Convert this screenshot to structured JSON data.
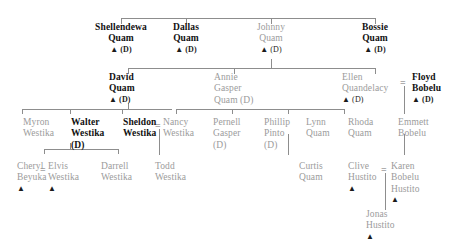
{
  "diagram": {
    "type": "genealogy-chart",
    "deceased_marker": "(D)",
    "potter_marker": "▲",
    "marriage_symbol": "=",
    "colors": {
      "line": "#8d8d8d",
      "gray_text": "#9b9b9b",
      "dark_text": "#1b1b1b",
      "bold_text": "#111111",
      "background": "#ffffff"
    }
  },
  "generations": [
    {
      "index": 1,
      "people": [
        {
          "id": "shellendewa_quam",
          "line1": "Shellendewa",
          "line2": "Quam",
          "marker": "▲ (D)",
          "style": "bold"
        },
        {
          "id": "dallas_quam",
          "line1": "Dallas",
          "line2": "Quam",
          "marker": "▲ (D)",
          "style": "bold"
        },
        {
          "id": "johnny_quam",
          "line1": "Johnny",
          "line2": "Quam",
          "marker": "▲ (D)",
          "style": "gray"
        },
        {
          "id": "bossie_quam",
          "line1": "Bossie",
          "line2": "Quam",
          "marker": "▲ (D)",
          "style": "bold"
        }
      ]
    },
    {
      "index": 2,
      "people": [
        {
          "id": "david_quam",
          "line1": "David",
          "line2": "Quam",
          "line3": "",
          "marker": "▲ (D)",
          "style": "bold"
        },
        {
          "id": "annie_gasper_quam",
          "line1": "Annie",
          "line2": "Gasper",
          "line3": "Quam (D)",
          "marker": "",
          "style": "gray"
        },
        {
          "id": "ellen_quandelacy",
          "line1": "Ellen",
          "line2": "Quandelacy",
          "line3": "",
          "marker": "▲ (D)",
          "style": "gray"
        },
        {
          "id": "floyd_bobelu",
          "line1": "Floyd",
          "line2": "Bobelu",
          "line3": "",
          "marker": "▲ (D)",
          "style": "bold"
        }
      ]
    },
    {
      "index": 3,
      "people": [
        {
          "id": "myron_westika",
          "line1": "Myron",
          "line2": "Westika",
          "line3": "",
          "marker": "",
          "style": "gray"
        },
        {
          "id": "walter_westika",
          "line1": "Walter",
          "line2": "Westika",
          "line3": "(D)",
          "marker": "",
          "style": "bold"
        },
        {
          "id": "sheldon_westika",
          "line1": "Sheldon",
          "line2": "Westika",
          "line3": "",
          "marker": "",
          "style": "bold"
        },
        {
          "id": "nancy_westika",
          "line1": "Nancy",
          "line2": "Westika",
          "line3": "",
          "marker": "",
          "style": "gray"
        },
        {
          "id": "pernell_gasper",
          "line1": "Pernell",
          "line2": "Gasper",
          "line3": "(D)",
          "marker": "",
          "style": "gray"
        },
        {
          "id": "phillip_pinto",
          "line1": "Phillip",
          "line2": "Pinto",
          "line3": "(D)",
          "marker": "",
          "style": "gray"
        },
        {
          "id": "lynn_quam",
          "line1": "Lynn",
          "line2": "Quam",
          "line3": "",
          "marker": "",
          "style": "gray"
        },
        {
          "id": "rhoda_quam",
          "line1": "Rhoda",
          "line2": "Quam",
          "line3": "",
          "marker": "",
          "style": "gray"
        },
        {
          "id": "emmett_bobelu",
          "line1": "Emmett",
          "line2": "Bobelu",
          "line3": "",
          "marker": "",
          "style": "gray"
        }
      ]
    },
    {
      "index": 4,
      "people": [
        {
          "id": "cheryl_beyuka",
          "line1": "Cheryl",
          "line2": "Beyuka",
          "line3": "",
          "marker": "▲",
          "style": "gray"
        },
        {
          "id": "elvis_westika",
          "line1": "Elvis",
          "line2": "Westika",
          "line3": "",
          "marker": "▲",
          "style": "gray"
        },
        {
          "id": "darrell_westika",
          "line1": "Darrell",
          "line2": "Westika",
          "line3": "",
          "marker": "",
          "style": "gray"
        },
        {
          "id": "todd_westika",
          "line1": "Todd",
          "line2": "Westika",
          "line3": "",
          "marker": "",
          "style": "gray"
        },
        {
          "id": "curtis_quam",
          "line1": "Curtis",
          "line2": "Quam",
          "line3": "",
          "marker": "",
          "style": "gray"
        },
        {
          "id": "clive_hustito",
          "line1": "Clive",
          "line2": "Hustito",
          "line3": "",
          "marker": "▲",
          "style": "gray"
        },
        {
          "id": "karen_bobelu_hustito",
          "line1": "Karen",
          "line2": "Bobelu",
          "line3": "Hustito",
          "marker": "▲",
          "style": "gray"
        }
      ]
    },
    {
      "index": 5,
      "people": [
        {
          "id": "jonas_hustito",
          "line1": "Jonas",
          "line2": "Hustito",
          "line3": "",
          "marker": "▲",
          "style": "gray"
        }
      ]
    }
  ],
  "marriages": [
    {
      "id": "ellen-floyd",
      "symbol": "="
    },
    {
      "id": "sheldon-nancy",
      "symbol": "="
    },
    {
      "id": "cheryl-elvis",
      "symbol": "="
    },
    {
      "id": "clive-karen",
      "symbol": "="
    }
  ]
}
